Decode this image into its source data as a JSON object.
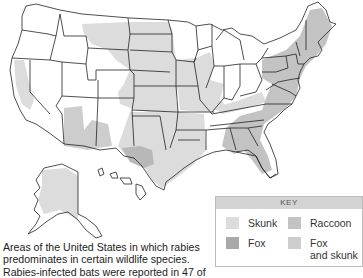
{
  "map": {
    "title": "Rabies in wildlife species, United States",
    "colors": {
      "outline": "#222222",
      "skunk": "#dcdcdc",
      "fox": "#a9a9a9",
      "raccoon": "#c3c3c3",
      "fox_and_skunk": "#cdcdcd",
      "unshaded": "#ffffff"
    }
  },
  "caption": {
    "text": "Areas of the United States in which rabies predominates in certain wildlife species. Rabies-infected bats were reported in 47 of"
  },
  "key": {
    "title": "KEY",
    "items": [
      {
        "label": "Skunk",
        "color": "#dcdcdc"
      },
      {
        "label": "Raccoon",
        "color": "#c3c3c3"
      },
      {
        "label": "Fox",
        "color": "#a9a9a9"
      },
      {
        "label": "Fox and skunk",
        "label_line1": "Fox",
        "label_line2": "and skunk",
        "color": "#cdcdcd"
      }
    ]
  }
}
